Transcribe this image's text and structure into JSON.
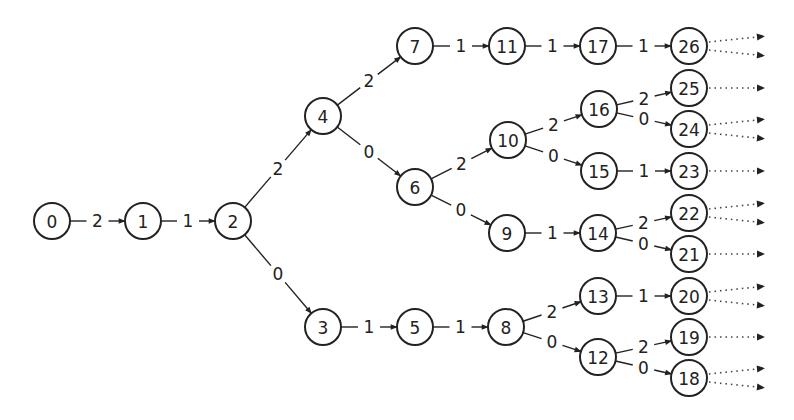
{
  "diagram": {
    "title": "",
    "type": "state-transition-tree",
    "node_radius": 18,
    "colors": {
      "stroke": "#222222",
      "background": "#ffffff"
    },
    "nodes": [
      {
        "id": "0",
        "label": "0",
        "x": 52,
        "y": 221
      },
      {
        "id": "1",
        "label": "1",
        "x": 143,
        "y": 221
      },
      {
        "id": "2",
        "label": "2",
        "x": 233,
        "y": 221
      },
      {
        "id": "3",
        "label": "3",
        "x": 323,
        "y": 327
      },
      {
        "id": "4",
        "label": "4",
        "x": 323,
        "y": 116
      },
      {
        "id": "5",
        "label": "5",
        "x": 415,
        "y": 327
      },
      {
        "id": "6",
        "label": "6",
        "x": 415,
        "y": 187
      },
      {
        "id": "7",
        "label": "7",
        "x": 415,
        "y": 46
      },
      {
        "id": "8",
        "label": "8",
        "x": 506,
        "y": 327
      },
      {
        "id": "9",
        "label": "9",
        "x": 507,
        "y": 233
      },
      {
        "id": "10",
        "label": "10",
        "x": 508,
        "y": 140
      },
      {
        "id": "11",
        "label": "11",
        "x": 507,
        "y": 46
      },
      {
        "id": "12",
        "label": "12",
        "x": 598,
        "y": 357
      },
      {
        "id": "13",
        "label": "13",
        "x": 598,
        "y": 296
      },
      {
        "id": "14",
        "label": "14",
        "x": 598,
        "y": 233
      },
      {
        "id": "15",
        "label": "15",
        "x": 599,
        "y": 171
      },
      {
        "id": "16",
        "label": "16",
        "x": 599,
        "y": 109
      },
      {
        "id": "17",
        "label": "17",
        "x": 598,
        "y": 46
      },
      {
        "id": "18",
        "label": "18",
        "x": 689,
        "y": 378
      },
      {
        "id": "19",
        "label": "19",
        "x": 689,
        "y": 337
      },
      {
        "id": "20",
        "label": "20",
        "x": 689,
        "y": 296
      },
      {
        "id": "21",
        "label": "21",
        "x": 689,
        "y": 254
      },
      {
        "id": "22",
        "label": "22",
        "x": 689,
        "y": 213
      },
      {
        "id": "23",
        "label": "23",
        "x": 689,
        "y": 171
      },
      {
        "id": "24",
        "label": "24",
        "x": 689,
        "y": 129
      },
      {
        "id": "25",
        "label": "25",
        "x": 689,
        "y": 88
      },
      {
        "id": "26",
        "label": "26",
        "x": 689,
        "y": 46
      }
    ],
    "edges": [
      {
        "from": "0",
        "to": "1",
        "label": "2"
      },
      {
        "from": "1",
        "to": "2",
        "label": "1"
      },
      {
        "from": "2",
        "to": "4",
        "label": "2"
      },
      {
        "from": "2",
        "to": "3",
        "label": "0"
      },
      {
        "from": "4",
        "to": "7",
        "label": "2"
      },
      {
        "from": "4",
        "to": "6",
        "label": "0"
      },
      {
        "from": "7",
        "to": "11",
        "label": "1"
      },
      {
        "from": "11",
        "to": "17",
        "label": "1"
      },
      {
        "from": "17",
        "to": "26",
        "label": "1"
      },
      {
        "from": "6",
        "to": "10",
        "label": "2"
      },
      {
        "from": "6",
        "to": "9",
        "label": "0"
      },
      {
        "from": "10",
        "to": "16",
        "label": "2"
      },
      {
        "from": "10",
        "to": "15",
        "label": "0"
      },
      {
        "from": "16",
        "to": "25",
        "label": "2"
      },
      {
        "from": "16",
        "to": "24",
        "label": "0"
      },
      {
        "from": "15",
        "to": "23",
        "label": "1"
      },
      {
        "from": "9",
        "to": "14",
        "label": "1"
      },
      {
        "from": "14",
        "to": "22",
        "label": "2"
      },
      {
        "from": "14",
        "to": "21",
        "label": "0"
      },
      {
        "from": "3",
        "to": "5",
        "label": "1"
      },
      {
        "from": "5",
        "to": "8",
        "label": "1"
      },
      {
        "from": "8",
        "to": "13",
        "label": "2"
      },
      {
        "from": "8",
        "to": "12",
        "label": "0"
      },
      {
        "from": "13",
        "to": "20",
        "label": "1"
      },
      {
        "from": "12",
        "to": "19",
        "label": "2"
      },
      {
        "from": "12",
        "to": "18",
        "label": "0"
      }
    ],
    "continuations": [
      {
        "from": "26",
        "count": 2
      },
      {
        "from": "25",
        "count": 1
      },
      {
        "from": "24",
        "count": 2
      },
      {
        "from": "23",
        "count": 1
      },
      {
        "from": "22",
        "count": 2
      },
      {
        "from": "21",
        "count": 1
      },
      {
        "from": "20",
        "count": 2
      },
      {
        "from": "19",
        "count": 1
      },
      {
        "from": "18",
        "count": 2
      }
    ]
  }
}
